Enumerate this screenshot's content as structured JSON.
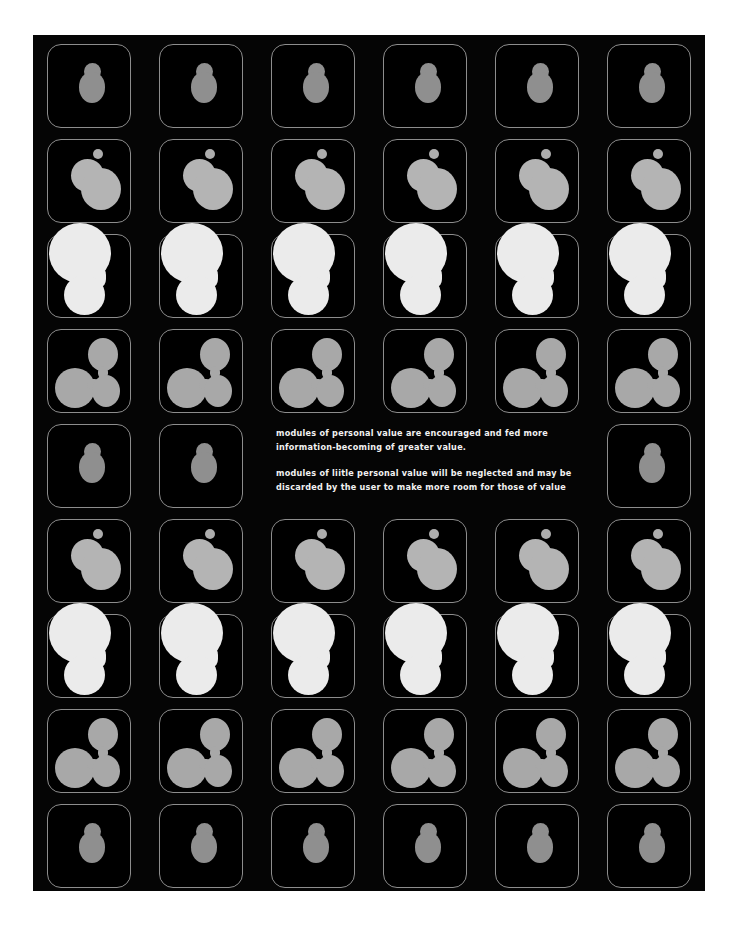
{
  "artwork": {
    "background_color": "#050505",
    "page_color": "#ffffff",
    "tile_border_color": "#8d8d8d",
    "columns": 6,
    "rows": 9
  },
  "caption": {
    "paragraph_1": "modules of personal value are encouraged and fed more information-becoming of greater value.",
    "paragraph_2": "modules of liitle personal value will be neglected and may be discarded by the user to make more room for those of value"
  },
  "stages": {
    "stage_1": {
      "name": "seed-module",
      "color": "#8f8f8f"
    },
    "stage_2": {
      "name": "growing-module",
      "color": "#b4b4b4"
    },
    "stage_3": {
      "name": "mature-module",
      "color": "#ebebeb"
    },
    "stage_4": {
      "name": "dividing-module",
      "color": "#a8a8a8"
    }
  },
  "grid": {
    "rows": [
      {
        "row": 1,
        "stage": "stage_1",
        "cells": [
          "stage_1",
          "stage_1",
          "stage_1",
          "stage_1",
          "stage_1",
          "stage_1"
        ]
      },
      {
        "row": 2,
        "stage": "stage_2",
        "cells": [
          "stage_2",
          "stage_2",
          "stage_2",
          "stage_2",
          "stage_2",
          "stage_2"
        ]
      },
      {
        "row": 3,
        "stage": "stage_3",
        "cells": [
          "stage_3",
          "stage_3",
          "stage_3",
          "stage_3",
          "stage_3",
          "stage_3"
        ]
      },
      {
        "row": 4,
        "stage": "stage_4",
        "cells": [
          "stage_4",
          "stage_4",
          "stage_4",
          "stage_4",
          "stage_4",
          "stage_4"
        ]
      },
      {
        "row": 5,
        "stage": "stage_1",
        "cells": [
          "stage_1",
          "stage_1",
          "caption",
          "caption",
          "caption",
          "stage_1"
        ]
      },
      {
        "row": 6,
        "stage": "stage_2",
        "cells": [
          "stage_2",
          "stage_2",
          "stage_2",
          "stage_2",
          "stage_2",
          "stage_2"
        ]
      },
      {
        "row": 7,
        "stage": "stage_3",
        "cells": [
          "stage_3",
          "stage_3",
          "stage_3",
          "stage_3",
          "stage_3",
          "stage_3"
        ]
      },
      {
        "row": 8,
        "stage": "stage_4",
        "cells": [
          "stage_4",
          "stage_4",
          "stage_4",
          "stage_4",
          "stage_4",
          "stage_4"
        ]
      },
      {
        "row": 9,
        "stage": "stage_1",
        "cells": [
          "stage_1",
          "stage_1",
          "stage_1",
          "stage_1",
          "stage_1",
          "stage_1"
        ]
      }
    ]
  }
}
